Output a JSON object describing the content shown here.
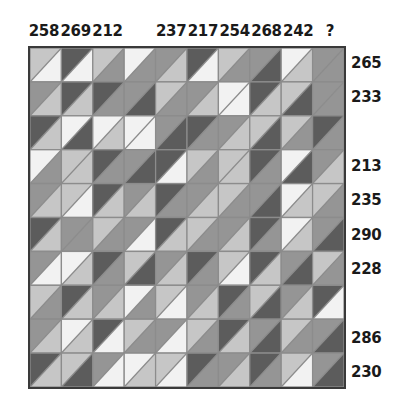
{
  "figure": {
    "type": "matrix-puzzle",
    "rows": 10,
    "cols": 10,
    "missing_marker": "?"
  },
  "column_headers": [
    "258",
    "269",
    "212",
    "",
    "237",
    "217",
    "254",
    "268",
    "242",
    "?"
  ],
  "row_headers": [
    "265",
    "233",
    "",
    "213",
    "235",
    "290",
    "228",
    "",
    "286",
    "230"
  ],
  "palette": {
    "white": "#f2f2f2",
    "light": "#c6c6c6",
    "medium": "#959595",
    "dark": "#5c5c5c",
    "cell_border": "#8c8c8c",
    "grid_border": "#3a3a3a",
    "text": "#1a1a1a",
    "background": "#ffffff"
  },
  "shade_keys": [
    "white",
    "light",
    "medium",
    "dark"
  ],
  "chart_data": {
    "type": "heatmap",
    "title": "",
    "xlabel": "",
    "ylabel": "",
    "categories": [
      "258",
      "269",
      "212",
      "",
      "237",
      "217",
      "254",
      "268",
      "242",
      "?"
    ],
    "row_categories": [
      "265",
      "233",
      "",
      "213",
      "235",
      "290",
      "228",
      "",
      "286",
      "230"
    ],
    "legend": [],
    "grid": true,
    "note": "Each cell is split along the anti-diagonal; upper-left triangle and lower-right triangle each carry one of four gray levels.",
    "cells": [
      [
        [
          "light",
          "white"
        ],
        [
          "dark",
          "white"
        ],
        [
          "light",
          "medium"
        ],
        [
          "white",
          "medium"
        ],
        [
          "medium",
          "light"
        ],
        [
          "dark",
          "white"
        ],
        [
          "light",
          "medium"
        ],
        [
          "medium",
          "dark"
        ],
        [
          "white",
          "light"
        ],
        [
          "medium",
          "medium"
        ]
      ],
      [
        [
          "medium",
          "light"
        ],
        [
          "dark",
          "light"
        ],
        [
          "dark",
          "medium"
        ],
        [
          "medium",
          "dark"
        ],
        [
          "light",
          "medium"
        ],
        [
          "medium",
          "light"
        ],
        [
          "white",
          "white"
        ],
        [
          "dark",
          "light"
        ],
        [
          "light",
          "dark"
        ],
        [
          "medium",
          "medium"
        ]
      ],
      [
        [
          "dark",
          "light"
        ],
        [
          "white",
          "dark"
        ],
        [
          "white",
          "light"
        ],
        [
          "white",
          "white"
        ],
        [
          "medium",
          "dark"
        ],
        [
          "dark",
          "medium"
        ],
        [
          "medium",
          "light"
        ],
        [
          "light",
          "dark"
        ],
        [
          "light",
          "medium"
        ],
        [
          "dark",
          "medium"
        ]
      ],
      [
        [
          "white",
          "medium"
        ],
        [
          "light",
          "light"
        ],
        [
          "dark",
          "medium"
        ],
        [
          "medium",
          "dark"
        ],
        [
          "dark",
          "white"
        ],
        [
          "light",
          "medium"
        ],
        [
          "light",
          "light"
        ],
        [
          "dark",
          "medium"
        ],
        [
          "white",
          "dark"
        ],
        [
          "medium",
          "light"
        ]
      ],
      [
        [
          "medium",
          "light"
        ],
        [
          "light",
          "white"
        ],
        [
          "dark",
          "light"
        ],
        [
          "medium",
          "light"
        ],
        [
          "dark",
          "medium"
        ],
        [
          "medium",
          "light"
        ],
        [
          "light",
          "medium"
        ],
        [
          "medium",
          "dark"
        ],
        [
          "white",
          "light"
        ],
        [
          "light",
          "medium"
        ]
      ],
      [
        [
          "dark",
          "light"
        ],
        [
          "medium",
          "medium"
        ],
        [
          "light",
          "medium"
        ],
        [
          "medium",
          "white"
        ],
        [
          "dark",
          "light"
        ],
        [
          "light",
          "medium"
        ],
        [
          "medium",
          "light"
        ],
        [
          "dark",
          "medium"
        ],
        [
          "white",
          "light"
        ],
        [
          "medium",
          "dark"
        ]
      ],
      [
        [
          "medium",
          "white"
        ],
        [
          "white",
          "light"
        ],
        [
          "dark",
          "medium"
        ],
        [
          "light",
          "dark"
        ],
        [
          "medium",
          "light"
        ],
        [
          "dark",
          "medium"
        ],
        [
          "light",
          "white"
        ],
        [
          "dark",
          "light"
        ],
        [
          "medium",
          "dark"
        ],
        [
          "light",
          "medium"
        ]
      ],
      [
        [
          "light",
          "medium"
        ],
        [
          "dark",
          "light"
        ],
        [
          "medium",
          "light"
        ],
        [
          "white",
          "medium"
        ],
        [
          "light",
          "white"
        ],
        [
          "medium",
          "light"
        ],
        [
          "dark",
          "medium"
        ],
        [
          "light",
          "dark"
        ],
        [
          "medium",
          "light"
        ],
        [
          "dark",
          "white"
        ]
      ],
      [
        [
          "medium",
          "light"
        ],
        [
          "white",
          "light"
        ],
        [
          "dark",
          "white"
        ],
        [
          "light",
          "medium"
        ],
        [
          "medium",
          "white"
        ],
        [
          "light",
          "medium"
        ],
        [
          "dark",
          "light"
        ],
        [
          "medium",
          "dark"
        ],
        [
          "light",
          "medium"
        ],
        [
          "medium",
          "dark"
        ]
      ],
      [
        [
          "dark",
          "light"
        ],
        [
          "light",
          "dark"
        ],
        [
          "medium",
          "white"
        ],
        [
          "white",
          "light"
        ],
        [
          "light",
          "white"
        ],
        [
          "dark",
          "medium"
        ],
        [
          "medium",
          "light"
        ],
        [
          "dark",
          "medium"
        ],
        [
          "light",
          "white"
        ],
        [
          "medium",
          "dark"
        ]
      ]
    ]
  }
}
